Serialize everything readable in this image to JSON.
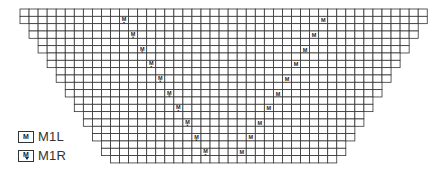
{
  "chart": {
    "type": "knitting-chart",
    "rows": 21,
    "max_cells": 45,
    "cell_width": 9.05,
    "cell_height": 7.33,
    "origin_x": 20,
    "origin_y": 9,
    "indent_every_rows": 2,
    "line_color": "#333333",
    "mark_color": "#222222",
    "m1r_marks": [
      {
        "row": 1,
        "col": 11
      },
      {
        "row": 3,
        "col": 12
      },
      {
        "row": 5,
        "col": 13
      },
      {
        "row": 7,
        "col": 14
      },
      {
        "row": 9,
        "col": 15
      },
      {
        "row": 11,
        "col": 16
      },
      {
        "row": 13,
        "col": 17
      },
      {
        "row": 15,
        "col": 18
      },
      {
        "row": 17,
        "col": 19
      },
      {
        "row": 19,
        "col": 20
      }
    ],
    "m1l_marks": [
      {
        "row": 1,
        "col": 33
      },
      {
        "row": 3,
        "col": 32
      },
      {
        "row": 5,
        "col": 31
      },
      {
        "row": 7,
        "col": 30
      },
      {
        "row": 9,
        "col": 29
      },
      {
        "row": 11,
        "col": 28
      },
      {
        "row": 13,
        "col": 27
      },
      {
        "row": 15,
        "col": 26
      },
      {
        "row": 17,
        "col": 25
      },
      {
        "row": 19,
        "col": 24
      }
    ],
    "mark_glyph": "M"
  },
  "legend": {
    "items": [
      {
        "symbol": "M",
        "label": "M1L"
      },
      {
        "symbol": "M",
        "label": "M1R"
      }
    ]
  }
}
